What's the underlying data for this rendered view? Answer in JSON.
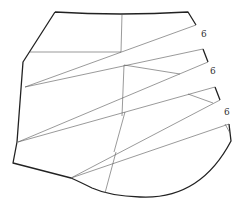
{
  "diagram": {
    "type": "sewing-pattern",
    "labels": [
      {
        "text": "6",
        "x": 204,
        "y": 37
      },
      {
        "text": "6",
        "x": 213,
        "y": 74
      },
      {
        "text": "6",
        "x": 227,
        "y": 115
      }
    ],
    "colors": {
      "line": "#222222",
      "background": "#ffffff"
    }
  }
}
